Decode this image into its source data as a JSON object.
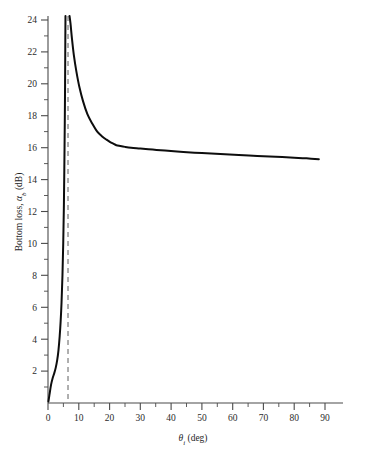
{
  "chart_data": {
    "type": "line",
    "title": "",
    "xlabel": "θᵢ (deg)",
    "ylabel": "Bottom loss, αₕ (dB)",
    "ylabel_parts": {
      "main": "Bottom loss, ",
      "symbol": "α",
      "subscript": "b",
      "units": " (dB)"
    },
    "xlabel_parts": {
      "symbol": "θ",
      "subscript": "i",
      "units": " (deg)"
    },
    "xlim": [
      0,
      96
    ],
    "ylim": [
      0,
      24.8
    ],
    "grid": false,
    "legend": null,
    "x_ticks": [
      0,
      10,
      20,
      30,
      40,
      50,
      60,
      70,
      80,
      90
    ],
    "x_tick_labels": [
      "0",
      "10",
      "20",
      "30",
      "40",
      "50",
      "60",
      "70",
      "80",
      "90"
    ],
    "x_minor_ticks": [
      5,
      15,
      25,
      35,
      45,
      55,
      65,
      75,
      85
    ],
    "y_ticks": [
      2,
      4,
      6,
      8,
      10,
      12,
      14,
      16,
      18,
      20,
      22,
      24
    ],
    "y_tick_labels": [
      "2",
      "4",
      "6",
      "8",
      "10",
      "12",
      "14",
      "16",
      "18",
      "20",
      "22",
      "24"
    ],
    "y_minor_ticks": [
      1,
      3,
      5,
      7,
      9,
      11,
      13,
      15,
      17,
      19,
      21,
      23
    ],
    "series": [
      {
        "name": "bottom loss",
        "color": "#0d0d0d",
        "style": "solid",
        "branches": [
          {
            "name": "sub-critical-branch",
            "x": [
              0.15,
              0.5,
              1.0,
              1.5,
              2.0,
              2.5,
              3.0,
              3.4,
              3.8,
              4.1,
              4.4,
              4.7,
              4.95,
              5.15,
              5.3,
              5.45,
              5.55,
              5.62,
              5.68
            ],
            "y": [
              0.1,
              0.55,
              1.15,
              1.55,
              1.85,
              2.2,
              2.7,
              3.3,
              4.2,
              5.1,
              6.3,
              8.0,
              10.0,
              12.2,
              14.6,
              17.5,
              20.0,
              22.5,
              24.6
            ]
          },
          {
            "name": "super-critical-branch",
            "x": [
              7.0,
              7.3,
              7.8,
              8.4,
              9.2,
              10.2,
              11.4,
              12.8,
              14.4,
              16.0,
              17.6,
              19.0,
              20.2,
              21.2,
              22.2,
              23.5,
              25.0,
              27.0,
              30.0,
              34.0,
              38.0,
              44.0,
              50.0,
              56.0,
              62.0,
              68.0,
              74.0,
              80.0,
              84.0,
              88.0
            ],
            "y": [
              24.6,
              23.8,
              22.8,
              21.8,
              20.8,
              19.8,
              18.9,
              18.1,
              17.5,
              17.0,
              16.7,
              16.5,
              16.35,
              16.25,
              16.15,
              16.1,
              16.05,
              16.0,
              15.95,
              15.88,
              15.82,
              15.73,
              15.66,
              15.6,
              15.54,
              15.48,
              15.43,
              15.37,
              15.33,
              15.28
            ]
          }
        ]
      }
    ],
    "annotations": [
      {
        "name": "critical-angle-line",
        "type": "vertical-dashed-line",
        "x": 6.5,
        "color": "#8e8e8e",
        "label": ""
      }
    ]
  }
}
